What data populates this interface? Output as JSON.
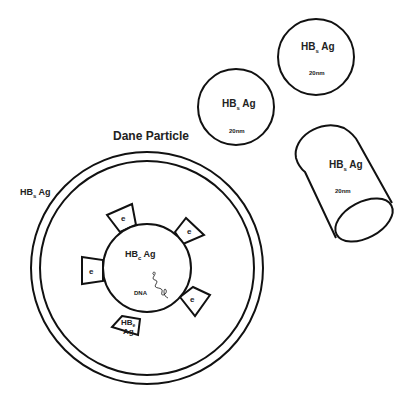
{
  "diagram": {
    "title": "Dane Particle",
    "outer_label": {
      "main": "HB",
      "sub": "s",
      "suffix": " Ag"
    },
    "core_label": {
      "main": "HB",
      "sub": "c",
      "suffix": " Ag"
    },
    "dna_label": "DNA",
    "e_label": "e",
    "hbe_label": {
      "line1": "HB",
      "sub": "e",
      "line2": "Ag"
    },
    "spheres": [
      {
        "label_main": "HB",
        "label_sub": "s",
        "label_suffix": " Ag",
        "size": "20nm"
      },
      {
        "label_main": "HB",
        "label_sub": "s",
        "label_suffix": " Ag",
        "size": "20nm"
      }
    ],
    "filament": {
      "label_main": "HB",
      "label_sub": "s",
      "label_suffix": " Ag",
      "size": "20nm"
    },
    "stroke_color": "#111111"
  }
}
